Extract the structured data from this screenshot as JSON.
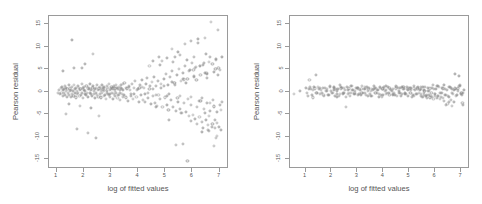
{
  "figure": {
    "background": "#ffffff",
    "point_color": "#8a8a8a",
    "axis_color": "#9a9a9a",
    "text_color": "#555555"
  },
  "chart_data": [
    {
      "type": "scatter",
      "panel": "left",
      "title": "",
      "xlabel": "log of fitted values",
      "ylabel": "Pearson residual",
      "xlim": [
        0.72,
        7.35
      ],
      "ylim": [
        -17.2,
        16.8
      ],
      "xticks": [
        1,
        2,
        3,
        4,
        5,
        6,
        7
      ],
      "xticklabels": [
        "1",
        "2",
        "3",
        "4",
        "5",
        "6",
        "7"
      ],
      "yticks": [
        -15,
        -10,
        -5,
        0,
        5,
        10,
        15
      ],
      "yticklabels": [
        "-15",
        "-10",
        "-5",
        "0",
        "5",
        "10",
        "15"
      ],
      "grid": false,
      "legend": "none",
      "marker": "open-circle",
      "annotation": "fan / funnel shape — residual spread increases with fitted values (heteroscedasticity)",
      "x": [
        1.05,
        1.08,
        1.12,
        1.15,
        1.18,
        1.2,
        1.22,
        1.24,
        1.26,
        1.28,
        1.3,
        1.32,
        1.34,
        1.36,
        1.38,
        1.4,
        1.42,
        1.44,
        1.46,
        1.48,
        1.5,
        1.52,
        1.54,
        1.56,
        1.58,
        1.6,
        1.62,
        1.64,
        1.66,
        1.68,
        1.7,
        1.72,
        1.74,
        1.76,
        1.78,
        1.8,
        1.82,
        1.84,
        1.86,
        1.88,
        1.9,
        1.92,
        1.94,
        1.96,
        1.98,
        2.0,
        2.02,
        2.04,
        2.06,
        2.08,
        2.1,
        2.12,
        2.14,
        2.16,
        2.18,
        2.2,
        2.22,
        2.24,
        2.26,
        2.28,
        2.3,
        2.32,
        2.34,
        2.36,
        2.38,
        2.4,
        2.42,
        2.44,
        2.46,
        2.48,
        2.5,
        2.52,
        2.54,
        2.56,
        2.58,
        2.6,
        2.62,
        2.64,
        2.66,
        2.68,
        2.7,
        2.72,
        2.74,
        2.76,
        2.78,
        2.8,
        2.82,
        2.84,
        2.86,
        2.88,
        2.9,
        2.92,
        2.94,
        2.96,
        2.98,
        3.0,
        3.02,
        3.04,
        3.06,
        3.08,
        3.1,
        3.12,
        3.14,
        3.16,
        3.18,
        3.2,
        3.22,
        3.24,
        3.26,
        3.28,
        3.3,
        3.32,
        3.34,
        3.36,
        3.38,
        3.4,
        3.42,
        3.44,
        3.46,
        3.48,
        3.5,
        3.54,
        3.58,
        3.62,
        3.66,
        3.7,
        3.74,
        3.78,
        3.82,
        3.86,
        3.9,
        3.94,
        3.98,
        4.02,
        4.06,
        4.1,
        4.14,
        4.18,
        4.22,
        4.26,
        4.3,
        4.34,
        4.38,
        4.42,
        4.46,
        4.5,
        4.54,
        4.58,
        4.62,
        4.66,
        4.7,
        4.74,
        4.78,
        4.82,
        4.86,
        4.9,
        4.94,
        4.98,
        5.02,
        5.06,
        5.1,
        5.14,
        5.18,
        5.22,
        5.26,
        5.3,
        5.34,
        5.38,
        5.42,
        5.46,
        5.5,
        5.54,
        5.58,
        5.62,
        5.66,
        5.7,
        5.74,
        5.78,
        5.82,
        5.86,
        5.9,
        5.94,
        5.98,
        6.02,
        6.06,
        6.1,
        6.14,
        6.18,
        6.22,
        6.26,
        6.3,
        6.34,
        6.38,
        6.42,
        6.46,
        6.5,
        6.54,
        6.58,
        6.62,
        6.66,
        6.7,
        6.74,
        6.78,
        6.82,
        6.86,
        6.9,
        6.94,
        6.98,
        7.02,
        7.06,
        7.1,
        1.35,
        1.55,
        1.75,
        1.95,
        2.15,
        2.35,
        2.55,
        2.75,
        2.95,
        3.15,
        3.35,
        3.55,
        3.75,
        3.95,
        4.15,
        4.35,
        4.55,
        4.75,
        4.95,
        5.15,
        5.35,
        5.55,
        5.75,
        5.95,
        6.15,
        6.35,
        6.55,
        6.75,
        6.95,
        7.08,
        1.25,
        1.45,
        1.65,
        1.85,
        2.05,
        2.25,
        2.45,
        2.65,
        2.85,
        3.05,
        3.25,
        3.45,
        3.65,
        3.85,
        4.05,
        4.25,
        4.45,
        4.65,
        4.85,
        5.05,
        5.25,
        5.45,
        5.65,
        5.85,
        6.05,
        6.25,
        6.45,
        6.65,
        6.85,
        7.0,
        4.42,
        4.66,
        4.88,
        5.12,
        5.36,
        5.58,
        5.82,
        6.04,
        6.28,
        6.52,
        6.74,
        6.96,
        4.55,
        4.8,
        5.05,
        5.3,
        5.55,
        5.8,
        6.05,
        6.3,
        6.55,
        6.8,
        7.05,
        6.48,
        6.62,
        6.84,
        6.9,
        6.72,
        6.58,
        6.36,
        6.2,
        5.96,
        5.72,
        5.48,
        5.24,
        6.5,
        6.66,
        6.88,
        6.44,
        6.28,
        6.08,
        5.88,
        5.64,
        5.4,
        6.8,
        6.86,
        6.92,
        6.6,
        6.4,
        6.18,
        5.94,
        5.7
      ],
      "y": [
        -0.3,
        0.4,
        -0.6,
        0.8,
        -0.2,
        1.1,
        -0.9,
        0.3,
        0.6,
        -0.4,
        1.3,
        -0.7,
        0.2,
        0.9,
        -1.1,
        0.5,
        -0.3,
        1.4,
        -0.8,
        0.1,
        0.7,
        -1.2,
        0.4,
        1.0,
        -0.5,
        0.2,
        -0.9,
        1.5,
        -0.3,
        0.6,
        -1.3,
        0.8,
        0.1,
        -0.6,
        1.2,
        -0.4,
        0.9,
        -1.0,
        0.3,
        0.5,
        -0.7,
        1.6,
        -0.2,
        0.8,
        -1.4,
        0.4,
        1.1,
        -0.5,
        0.2,
        -0.8,
        1.3,
        -0.3,
        0.7,
        -1.2,
        0.5,
        0.9,
        -0.4,
        1.7,
        -0.6,
        0.3,
        -1.0,
        0.8,
        1.2,
        -0.5,
        0.1,
        -1.5,
        0.6,
        0.9,
        -0.3,
        1.4,
        -0.8,
        0.4,
        -1.1,
        0.7,
        1.0,
        -0.6,
        0.2,
        -1.3,
        1.5,
        -0.4,
        0.8,
        0.3,
        -0.9,
        1.1,
        -0.7,
        0.5,
        -1.6,
        1.2,
        0.1,
        -0.5,
        0.9,
        1.8,
        -0.8,
        0.4,
        -1.2,
        0.6,
        1.0,
        -0.3,
        -1.7,
        0.7,
        1.3,
        -0.6,
        0.2,
        -1.0,
        1.5,
        -0.4,
        0.8,
        -1.4,
        0.5,
        1.1,
        -0.7,
        0.3,
        -1.9,
        0.9,
        1.4,
        -0.5,
        0.6,
        -1.1,
        1.6,
        -0.8,
        2.0,
        -1.3,
        0.7,
        -2.1,
        1.2,
        0.4,
        -0.9,
        1.8,
        -1.6,
        0.8,
        2.3,
        -1.2,
        0.5,
        -2.4,
        1.5,
        -0.7,
        2.6,
        -1.8,
        0.9,
        -2.2,
        1.7,
        3.0,
        -1.4,
        0.6,
        -2.8,
        2.1,
        -1.0,
        3.3,
        -2.5,
        1.2,
        -3.1,
        2.4,
        7.8,
        -1.6,
        0.8,
        -3.5,
        2.8,
        -1.3,
        4.0,
        -2.9,
        1.5,
        -6.2,
        3.2,
        -1.8,
        4.6,
        -3.4,
        2.0,
        -4.2,
        3.7,
        -2.2,
        5.1,
        -3.9,
        2.4,
        -4.8,
        4.2,
        -2.6,
        5.7,
        -4.5,
        2.8,
        -5.4,
        4.8,
        -3.0,
        6.3,
        -5.1,
        3.2,
        -6.0,
        5.4,
        -3.4,
        11.6,
        -5.7,
        3.6,
        -6.8,
        6.0,
        -3.8,
        11.9,
        -6.4,
        4.0,
        -7.4,
        6.6,
        -4.2,
        15.4,
        -7.1,
        4.4,
        -8.0,
        7.2,
        -4.6,
        13.7,
        -7.8,
        4.8,
        -8.6,
        7.8,
        -5.0,
        11.5,
        -8.4,
        5.2,
        -9.2,
        8.4,
        -5.4,
        0.2,
        -0.5,
        0.7,
        -0.2,
        0.9,
        -0.6,
        0.3,
        1.0,
        -0.4,
        0.6,
        -0.8,
        1.2,
        -0.5,
        1.5,
        -0.9,
        2.0,
        -1.2,
        2.6,
        -1.5,
        3.1,
        -1.9,
        3.8,
        -2.3,
        4.5,
        -2.7,
        5.3,
        -3.2,
        6.1,
        -3.7,
        -10.3,
        0.5,
        -0.3,
        0.8,
        -0.7,
        0.4,
        1.1,
        -0.5,
        0.9,
        -0.6,
        1.3,
        -0.8,
        1.7,
        -1.0,
        2.2,
        -1.4,
        2.9,
        -1.7,
        3.5,
        -2.1,
        4.2,
        -2.5,
        5.0,
        -3.0,
        5.8,
        -3.5,
        6.9,
        -4.1,
        7.6,
        -4.7,
        -15.5,
        4.9,
        5.6,
        4.2,
        6.1,
        5.3,
        6.8,
        5.9,
        7.4,
        6.5,
        8.2,
        7.0,
        7.6,
        -2.0,
        -2.6,
        -3.3,
        -4.0,
        -4.7,
        -5.5,
        -6.2,
        -7.0,
        -7.8,
        -8.5,
        -9.0,
        10.9,
        11.2,
        10.5,
        8.9,
        9.5,
        8.3,
        7.7,
        7.1,
        6.4,
        5.8,
        5.2,
        4.6,
        -11.6,
        -11.9,
        -12.0,
        -10.4,
        -9.8,
        -8.8,
        -8.0,
        -7.2,
        -6.5,
        2.7,
        3.3,
        2.1,
        1.6,
        1.0,
        0.5,
        -0.4,
        -1.0
      ]
    },
    {
      "type": "scatter",
      "panel": "right",
      "title": "",
      "xlabel": "log of fitted values",
      "ylabel": "Pearson residual",
      "xlim": [
        0.4,
        7.35
      ],
      "ylim": [
        -17.2,
        16.8
      ],
      "xticks": [
        1,
        2,
        3,
        4,
        5,
        6,
        7
      ],
      "xticklabels": [
        "1",
        "2",
        "3",
        "4",
        "5",
        "6",
        "7"
      ],
      "yticks": [
        -15,
        -10,
        -5,
        0,
        5,
        10,
        15
      ],
      "yticklabels": [
        "-15",
        "-10",
        "-5",
        "0",
        "5",
        "10",
        "15"
      ],
      "grid": false,
      "legend": "none",
      "marker": "open-circle",
      "annotation": "homoscedastic band — residuals evenly scattered about zero",
      "x": [
        0.55,
        0.8,
        1.0,
        1.06,
        1.12,
        1.18,
        1.24,
        1.3,
        1.36,
        1.42,
        1.48,
        1.54,
        1.6,
        1.66,
        1.72,
        1.78,
        1.84,
        1.9,
        1.96,
        2.02,
        2.08,
        2.14,
        2.2,
        2.26,
        2.32,
        2.38,
        2.44,
        2.5,
        2.56,
        2.62,
        2.68,
        2.74,
        2.8,
        2.86,
        2.92,
        2.98,
        3.04,
        3.1,
        3.16,
        3.22,
        3.28,
        3.34,
        3.4,
        3.46,
        3.52,
        3.58,
        3.64,
        3.7,
        3.76,
        3.82,
        3.88,
        3.94,
        4.0,
        4.06,
        4.12,
        4.18,
        4.24,
        4.3,
        4.36,
        4.42,
        4.48,
        4.54,
        4.6,
        4.66,
        4.72,
        4.78,
        4.84,
        4.9,
        4.96,
        5.02,
        5.08,
        5.14,
        5.2,
        5.26,
        5.32,
        5.38,
        5.44,
        5.5,
        5.56,
        5.62,
        5.68,
        5.74,
        5.8,
        5.86,
        5.92,
        5.98,
        6.04,
        6.1,
        6.16,
        6.22,
        6.28,
        6.34,
        6.4,
        6.46,
        6.52,
        6.58,
        6.64,
        6.7,
        6.76,
        6.82,
        6.88,
        6.94,
        7.0,
        7.06,
        7.12,
        1.09,
        1.21,
        1.33,
        1.45,
        1.57,
        1.69,
        1.81,
        1.93,
        2.05,
        2.17,
        2.29,
        2.41,
        2.53,
        2.65,
        2.77,
        2.89,
        3.01,
        3.13,
        3.25,
        3.37,
        3.49,
        3.61,
        3.73,
        3.85,
        3.97,
        4.09,
        4.21,
        4.33,
        4.45,
        4.57,
        4.69,
        4.81,
        4.93,
        5.05,
        5.17,
        5.29,
        5.41,
        5.53,
        5.65,
        5.77,
        5.89,
        6.01,
        6.13,
        6.25,
        6.37,
        6.49,
        6.61,
        6.73,
        6.85,
        6.97,
        7.09,
        1.15,
        1.27,
        1.39,
        1.51,
        1.63,
        1.75,
        1.87,
        1.99,
        2.11,
        2.23,
        2.35,
        2.47,
        2.59,
        2.71,
        2.83,
        2.95,
        3.07,
        3.19,
        3.31,
        3.43,
        3.55,
        3.67,
        3.79,
        3.91,
        4.03,
        4.15,
        4.27,
        4.39,
        4.51,
        4.63,
        4.75,
        4.87,
        4.99,
        5.11,
        5.23,
        5.35,
        5.47,
        5.59,
        5.71,
        5.83,
        5.95,
        6.07,
        6.19,
        6.31,
        6.43,
        6.55,
        6.67,
        6.79,
        6.91,
        7.03,
        2.08,
        2.2,
        2.32,
        2.44,
        2.56,
        2.68,
        2.8,
        2.92,
        3.04,
        3.16,
        3.28,
        3.4,
        3.52,
        3.64,
        3.76,
        3.88,
        4.0,
        4.12,
        4.24,
        4.36,
        4.48,
        4.6,
        4.72,
        4.84,
        4.96,
        5.08,
        5.2,
        5.32,
        5.44,
        5.56,
        6.78,
        6.84,
        6.9,
        6.96,
        7.02,
        7.08,
        6.66,
        6.72,
        6.6,
        6.54,
        6.48,
        6.42,
        6.36,
        6.3,
        6.24,
        6.18,
        6.12,
        6.06,
        6.0,
        5.94,
        5.88,
        5.82,
        5.76,
        5.7,
        5.64,
        5.58,
        5.52,
        5.46
      ],
      "y": [
        -0.5,
        0.2,
        0.9,
        -0.4,
        0.6,
        1.0,
        -0.8,
        0.3,
        0.7,
        -0.2,
        1.1,
        -0.6,
        0.4,
        0.8,
        -1.0,
        0.1,
        0.5,
        -0.7,
        1.2,
        -0.3,
        0.9,
        -0.9,
        0.2,
        0.6,
        -0.5,
        1.0,
        -0.2,
        0.8,
        -1.1,
        0.3,
        0.7,
        -0.4,
        1.3,
        -0.6,
        0.1,
        0.9,
        -0.8,
        0.4,
        0.6,
        -0.3,
        1.1,
        -0.7,
        0.2,
        0.8,
        -1.0,
        0.5,
        1.2,
        -0.4,
        0.3,
        -0.6,
        0.9,
        -1.2,
        0.7,
        0.1,
        -0.5,
        1.0,
        -0.8,
        0.4,
        0.6,
        -0.3,
        1.3,
        -0.9,
        0.2,
        0.8,
        -0.6,
        1.1,
        -0.4,
        0.5,
        -1.0,
        0.7,
        0.3,
        -0.7,
        1.2,
        -0.5,
        0.9,
        -0.2,
        0.6,
        -1.1,
        0.4,
        1.0,
        -0.8,
        0.2,
        0.7,
        -0.4,
        1.4,
        -0.6,
        0.5,
        -0.9,
        1.1,
        -0.3,
        0.8,
        1.5,
        -0.7,
        0.4,
        -1.2,
        1.0,
        0.6,
        -0.5,
        3.9,
        -1.0,
        0.7,
        3.4,
        -0.6,
        -2.6,
        0.3,
        -0.9,
        0.5,
        1.0,
        -0.4,
        0.8,
        -0.7,
        0.2,
        1.1,
        -0.3,
        0.6,
        -1.0,
        0.9,
        0.4,
        -0.6,
        1.2,
        -0.2,
        0.7,
        -0.8,
        0.5,
        1.0,
        -0.5,
        0.3,
        0.8,
        -1.1,
        0.6,
        1.3,
        -0.4,
        0.2,
        -0.7,
        0.9,
        -1.0,
        0.5,
        1.1,
        -0.3,
        0.7,
        -0.6,
        0.4,
        1.0,
        -0.9,
        0.2,
        0.8,
        -0.5,
        1.2,
        -0.2,
        0.6,
        -1.0,
        0.9,
        0.3,
        -0.7,
        1.4,
        -0.4,
        2.6,
        -1.3,
        3.6,
        0.6,
        -0.4,
        0.9,
        -0.8,
        0.2,
        1.0,
        -0.5,
        0.7,
        -0.3,
        1.1,
        -0.9,
        0.4,
        0.8,
        -0.6,
        1.2,
        -0.2,
        0.5,
        -1.0,
        0.9,
        0.3,
        -0.7,
        1.0,
        -0.4,
        0.6,
        -0.8,
        1.1,
        -0.3,
        0.7,
        -0.5,
        0.9,
        -1.1,
        0.4,
        1.0,
        -0.6,
        0.2,
        0.8,
        -0.9,
        0.5,
        1.2,
        -0.3,
        0.7,
        -0.7,
        1.0,
        -0.4,
        0.6,
        1.3,
        -0.8,
        0.3,
        -1.1,
        1.5,
        -0.5,
        -3.5,
        -0.2,
        0.4,
        -0.6,
        0.8,
        -0.3,
        0.5,
        -0.9,
        0.2,
        0.6,
        -0.4,
        1.0,
        -0.7,
        0.3,
        0.9,
        -0.5,
        0.7,
        -0.2,
        1.1,
        -0.6,
        0.4,
        0.8,
        -0.9,
        0.5,
        1.0,
        -0.3,
        0.7,
        -0.8,
        0.2,
        1.2,
        -0.4,
        -2.9,
        -3.2,
        -2.4,
        -1.9,
        -2.2,
        -2.7,
        -3.0,
        -2.1,
        -1.5,
        -1.2,
        -1.7,
        -1.0,
        -1.4,
        -0.9,
        -1.6,
        -1.1,
        -1.3,
        -0.8,
        -1.5,
        -1.0,
        -0.7,
        -1.2,
        -0.9,
        -1.4,
        -0.6,
        -1.1,
        -0.8,
        -1.3
      ]
    }
  ]
}
